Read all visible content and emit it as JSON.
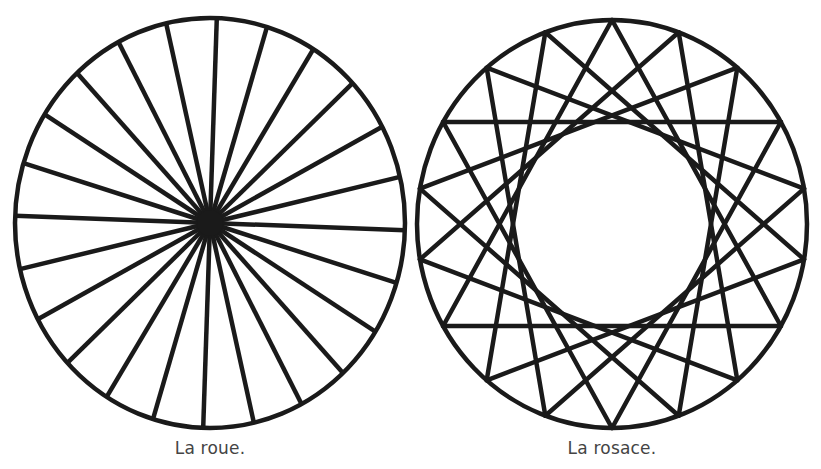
{
  "figures": [
    {
      "id": "wheel",
      "caption": "La roue.",
      "type": "spoked-circle",
      "spokes": 24,
      "center": [
        210,
        223
      ],
      "radius": [
        195,
        205
      ],
      "rotation_deg": 2,
      "hub_radius": 13
    },
    {
      "id": "rosace",
      "caption": "La rosace.",
      "type": "star-polygon",
      "vertices": 18,
      "step": 6,
      "center": [
        612,
        224
      ],
      "radius": [
        195,
        204
      ],
      "rotation_deg": 0
    }
  ],
  "style": {
    "stroke": "#1a1a1a",
    "stroke_width": 4.5,
    "caption_color": "#444444"
  }
}
